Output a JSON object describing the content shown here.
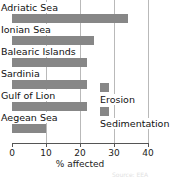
{
  "chart_data": {
    "type": "bar",
    "orientation": "horizontal",
    "title": "",
    "xlabel": "% affected",
    "ylabel": "",
    "xlim": [
      0,
      40
    ],
    "xticks": [
      0,
      10,
      20,
      30,
      40
    ],
    "xticklabels": [
      "0",
      "10",
      "20",
      "30",
      "40"
    ],
    "grid": true,
    "grid_axis": "x",
    "categories": [
      "Adriatic Sea",
      "Ionian Sea",
      "Balearic Islands",
      "Sardinia",
      "Gulf of Lion",
      "Aegean Sea"
    ],
    "values": [
      34,
      24,
      22,
      22,
      22,
      10
    ],
    "series": [
      {
        "name": "Erosion",
        "categories": [
          "Adriatic Sea",
          "Ionian Sea",
          "Balearic Islands",
          "Sardinia",
          "Gulf of Lion",
          "Aegean Sea"
        ],
        "values": [
          34,
          24,
          22,
          22,
          22,
          10
        ],
        "color": "#878787"
      }
    ],
    "legend": {
      "position": "inside-right",
      "entries": [
        {
          "label": "Erosion",
          "color": "#878787"
        },
        {
          "label": "Sedimentation",
          "color": "#878787"
        }
      ]
    },
    "colors": {
      "bar": "#878787",
      "grid": "#b9b9b9",
      "axis": "#555555",
      "text": "#111111",
      "background": "#ffffff"
    }
  },
  "bars": [
    {
      "label": "Adriatic Sea",
      "value": 34,
      "label_top": 2,
      "bar_top": 14
    },
    {
      "label": "Ionian Sea",
      "value": 24,
      "label_top": 24,
      "bar_top": 36
    },
    {
      "label": "Balearic Islands",
      "value": 22,
      "label_top": 46,
      "bar_top": 58
    },
    {
      "label": "Sardinia",
      "value": 22,
      "label_top": 68,
      "bar_top": 80
    },
    {
      "label": "Gulf of Lion",
      "value": 22,
      "label_top": 90,
      "bar_top": 102
    },
    {
      "label": "Aegean Sea",
      "value": 10,
      "label_top": 112,
      "bar_top": 124
    }
  ],
  "axis": {
    "title": "% affected",
    "ticks": [
      {
        "label": "0",
        "value": 0
      },
      {
        "label": "10",
        "value": 10
      },
      {
        "label": "20",
        "value": 20
      },
      {
        "label": "30",
        "value": 30
      },
      {
        "label": "40",
        "value": 40
      }
    ]
  },
  "legend": {
    "erosion_label": "Erosion",
    "sedimentation_label": "Sedimentation"
  },
  "footer": {
    "source_note": "Source: EEA"
  }
}
